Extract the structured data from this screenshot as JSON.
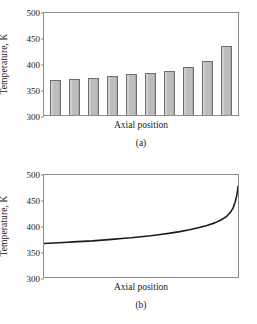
{
  "figure": {
    "panels": [
      {
        "caption": "(a)",
        "xlabel": "Axial position",
        "ylabel": "Temperature, K"
      },
      {
        "caption": "(b)",
        "xlabel": "Axial position",
        "ylabel": "Temperature, K"
      }
    ],
    "yticks": [
      "300",
      "350",
      "400",
      "450",
      "500"
    ],
    "colors": {
      "bar_fill": "#bdbdbd",
      "bar_border": "#6f6f6f",
      "frame": "#8d8d8d",
      "curve": "#1a1a1a"
    }
  },
  "chart_data": [
    {
      "type": "bar",
      "title": "",
      "panel": "(a)",
      "xlabel": "Axial position",
      "ylabel": "Temperature, K",
      "ylim": [
        300,
        500
      ],
      "yticks": [
        300,
        350,
        400,
        450,
        500
      ],
      "grid": false,
      "legend": "none",
      "categories": [
        "1",
        "2",
        "3",
        "4",
        "5",
        "6",
        "7",
        "8",
        "9",
        "10"
      ],
      "values": [
        368,
        370,
        372,
        375,
        378,
        381,
        385,
        392,
        404,
        432
      ]
    },
    {
      "type": "line",
      "title": "",
      "panel": "(b)",
      "xlabel": "Axial position",
      "ylabel": "Temperature, K",
      "ylim": [
        300,
        500
      ],
      "yticks": [
        300,
        350,
        400,
        450,
        500
      ],
      "xlim": [
        0,
        1
      ],
      "grid": false,
      "legend": "none",
      "series": [
        {
          "name": "Temperature profile",
          "x": [
            0.0,
            0.05,
            0.1,
            0.15,
            0.2,
            0.25,
            0.3,
            0.35,
            0.4,
            0.45,
            0.5,
            0.55,
            0.6,
            0.65,
            0.7,
            0.75,
            0.8,
            0.84,
            0.88,
            0.91,
            0.94,
            0.96,
            0.975,
            0.985,
            0.993,
            0.998,
            1.0
          ],
          "values": [
            367,
            368,
            369,
            370,
            371,
            372,
            373.5,
            375,
            376.5,
            378,
            380,
            382,
            384.5,
            387,
            390,
            393.5,
            398,
            402,
            407,
            412,
            419,
            427,
            436,
            447,
            459,
            470,
            478
          ]
        }
      ]
    }
  ]
}
